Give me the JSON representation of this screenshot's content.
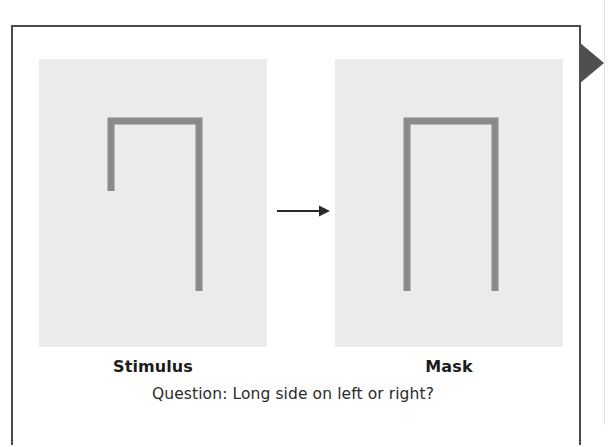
{
  "figure": {
    "frame_border_color": "#4a4a4a",
    "background_color": "#ffffff",
    "edge_marker_name": "right-pointing-triangle-marker",
    "edge_marker_color": "#4f4f4f"
  },
  "panels": [
    {
      "id": "stimulus",
      "caption": "Stimulus",
      "background_color": "#ebebeb",
      "stroke_color": "#8a8a8a",
      "shape": "inverted-u-asymmetric",
      "description": "Inverted U shape with a short left leg and a long right leg",
      "left_leg_long": false,
      "right_leg_long": true
    },
    {
      "id": "mask",
      "caption": "Mask",
      "background_color": "#ebebeb",
      "stroke_color": "#8a8a8a",
      "shape": "inverted-u-symmetric",
      "description": "Inverted U shape with both legs equal and long",
      "left_leg_long": true,
      "right_leg_long": true
    }
  ],
  "arrow": {
    "name": "rightward-transition-arrow",
    "direction": "right",
    "color": "#2a2a2a"
  },
  "question": {
    "text": "Question: Long side on left or right?"
  }
}
